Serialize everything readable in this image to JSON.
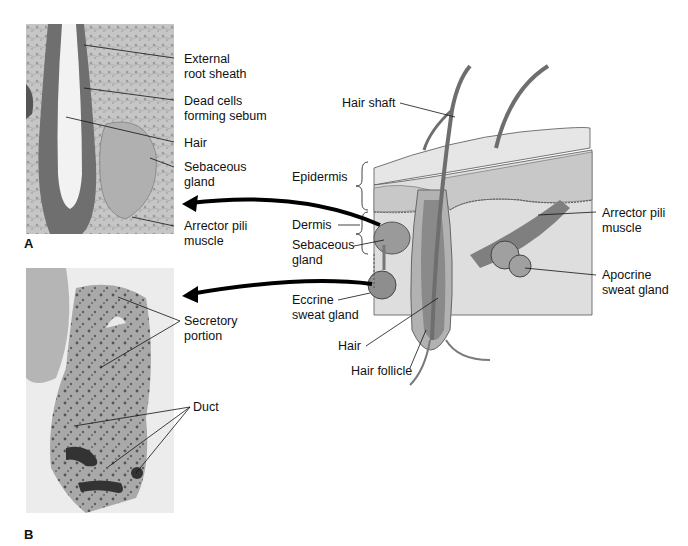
{
  "figure": {
    "panels": {
      "A": {
        "letter": "A",
        "labels": {
          "external_root_sheath": [
            "External",
            "root sheath"
          ],
          "dead_cells": [
            "Dead cells",
            "forming sebum"
          ],
          "hair": [
            "Hair"
          ],
          "sebaceous_gland": [
            "Sebaceous",
            "gland"
          ],
          "arrector_pili": [
            "Arrector pili",
            "muscle"
          ]
        }
      },
      "B": {
        "letter": "B",
        "labels": {
          "secretory_portion": [
            "Secretory",
            "portion"
          ],
          "duct": [
            "Duct"
          ]
        }
      }
    },
    "skin_diagram": {
      "labels": {
        "hair_shaft": [
          "Hair shaft"
        ],
        "epidermis": [
          "Epidermis"
        ],
        "dermis": [
          "Dermis"
        ],
        "sebaceous_gland": [
          "Sebaceous",
          "gland"
        ],
        "eccrine_sweat_gland": [
          "Eccrine",
          "sweat gland"
        ],
        "hair": [
          "Hair"
        ],
        "hair_follicle": [
          "Hair follicle"
        ],
        "arrector_pili_muscle": [
          "Arrector pili",
          "muscle"
        ],
        "apocrine_sweat_gland": [
          "Apocrine",
          "sweat gland"
        ]
      }
    },
    "colors": {
      "micrograph_bg": "#b9b9b9",
      "skin_surface": "#e4e4e4",
      "epidermis_band": "#c9c9c9",
      "dermis": "#dcdcdc",
      "follicle": "#8a8a8a",
      "hair": "#6e6e6e",
      "arrow": "#000000"
    }
  }
}
